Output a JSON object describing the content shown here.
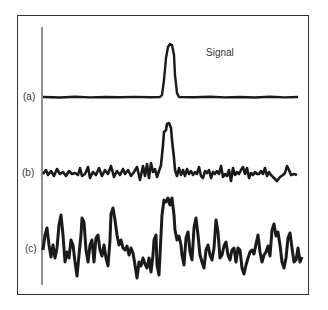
{
  "figure": {
    "annotation": "Signal",
    "traces": [
      {
        "label": "(a)",
        "description": "Signal with very low noise",
        "baseline_y": 97,
        "peak_x": 170,
        "peak_top_y": 44
      },
      {
        "label": "(b)",
        "description": "Signal with moderate noise",
        "baseline_y": 173,
        "peak_x": 168,
        "peak_top_y": 123
      },
      {
        "label": "(c)",
        "description": "Signal with high noise",
        "baseline_y": 248,
        "peak_x": 167,
        "peak_top_y": 197
      }
    ]
  },
  "labels": {
    "a": "(a)",
    "b": "(b)",
    "c": "(c)",
    "signal": "Signal"
  }
}
